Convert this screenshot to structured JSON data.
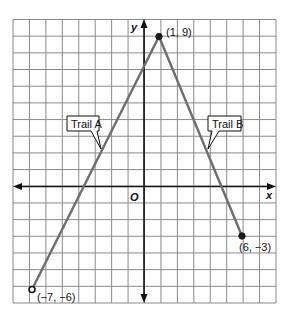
{
  "diagram": {
    "type": "coordinate-plane",
    "axes": {
      "x_label": "x",
      "y_label": "y",
      "origin_label": "O"
    },
    "grid": {
      "x_min": -8,
      "x_max": 8,
      "y_min": -7,
      "y_max": 10
    },
    "points": [
      {
        "id": "peak",
        "x": 1,
        "y": 9,
        "label": "(1, 9)"
      },
      {
        "id": "trail-a-start",
        "x": -7,
        "y": -6,
        "label": "(−7, −6)"
      },
      {
        "id": "trail-b-end",
        "x": 6,
        "y": -3,
        "label": "(6, −3)"
      }
    ],
    "trails": [
      {
        "name": "Trail A",
        "from": [
          -7,
          -6
        ],
        "to": [
          1,
          9
        ]
      },
      {
        "name": "Trail B",
        "from": [
          1,
          9
        ],
        "to": [
          6,
          -3
        ]
      }
    ],
    "callouts": {
      "trail_a": "Trail A",
      "trail_b": "Trail B"
    }
  },
  "colors": {
    "grid": "#8a8a8a",
    "axis": "#111111",
    "trail": "#6e6e6e",
    "point": "#1a1a1a"
  }
}
